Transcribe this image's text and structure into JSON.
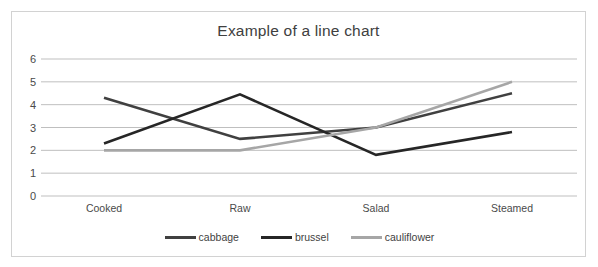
{
  "chart_data": {
    "type": "line",
    "title": "Example of a line chart",
    "xlabel": "",
    "ylabel": "",
    "categories": [
      "Cooked",
      "Raw",
      "Salad",
      "Steamed"
    ],
    "series": [
      {
        "name": "cabbage",
        "values": [
          4.3,
          2.5,
          3.0,
          4.5
        ],
        "color": "#404040"
      },
      {
        "name": "brussel",
        "values": [
          2.3,
          4.45,
          1.8,
          2.8
        ],
        "color": "#262626"
      },
      {
        "name": "cauliflower",
        "values": [
          2.0,
          2.0,
          3.0,
          5.0
        ],
        "color": "#a6a6a6"
      }
    ],
    "ylim": [
      0,
      6
    ],
    "yticks": [
      0,
      1,
      2,
      3,
      4,
      5,
      6
    ],
    "ytick_labels": [
      "0",
      "1",
      "2",
      "3",
      "4",
      "5",
      "6"
    ],
    "grid": true,
    "grid_color": "#bfbfbf",
    "legend_position": "bottom",
    "border_color": "#d2d2d2",
    "background": "#ffffff"
  }
}
